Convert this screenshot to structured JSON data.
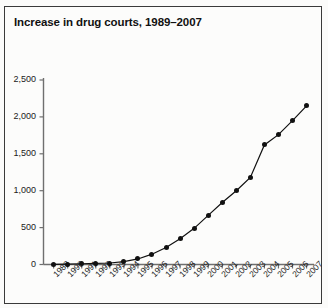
{
  "figure": {
    "title": "Increase in drug courts, 1989–2007",
    "border_color": "#3a3a3a",
    "background": "#fcfcfb"
  },
  "chart_data": {
    "type": "line",
    "title": "Increase in drug courts, 1989–2007",
    "xlabel": "",
    "ylabel": "",
    "categories": [
      "1989",
      "1990",
      "1991",
      "1992",
      "1993",
      "1994",
      "1995",
      "1996",
      "1997",
      "1998",
      "1999",
      "2000",
      "2001",
      "2002",
      "2003",
      "2004",
      "2005",
      "2006",
      "2007"
    ],
    "values": [
      1,
      5,
      10,
      15,
      20,
      40,
      75,
      140,
      230,
      350,
      490,
      665,
      840,
      1000,
      1180,
      1620,
      1760,
      1950,
      2150
    ],
    "series": [
      {
        "name": "Drug courts",
        "values": [
          1,
          5,
          10,
          15,
          20,
          40,
          75,
          140,
          230,
          350,
          490,
          665,
          840,
          1000,
          1180,
          1620,
          1760,
          1950,
          2150
        ],
        "marker": "filled-circle",
        "color": "#111111"
      }
    ],
    "ylim": [
      0,
      2500
    ],
    "yticks": [
      0,
      500,
      1000,
      1500,
      2000,
      2500
    ],
    "ytick_labels": [
      "0",
      "500",
      "1,000",
      "1,500",
      "2,000",
      "2,500"
    ],
    "grid": false,
    "legend": "none",
    "xtick_rotation": -45
  }
}
